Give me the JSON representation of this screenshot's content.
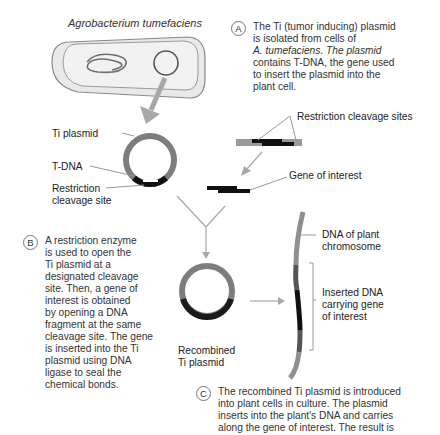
{
  "organism_title": "Agrobacterium tumefaciens",
  "steps": {
    "A": {
      "marker": "A",
      "lines": [
        "The Ti (tumor inducing) plasmid",
        "is isolated from cells of",
        "A. tumefaciens. The plasmid",
        "contains T-DNA, the gene used",
        "to insert the plasmid into the",
        "plant cell."
      ]
    },
    "B": {
      "marker": "B",
      "lines": [
        "A restriction enzyme",
        "is used to open the",
        "Ti plasmid at a",
        "designated cleavage",
        "site. Then, a gene of",
        "interest is obtained",
        "by opening a DNA",
        "fragment at the same",
        "cleavage site. The gene",
        "is inserted into the Ti",
        "plasmid using DNA",
        "ligase to seal the",
        "chemical bonds."
      ]
    },
    "C": {
      "marker": "C",
      "lines": [
        "The recombined Ti plasmid is introduced",
        "into plant cells in culture. The plasmid",
        "inserts into the plant's DNA and carries",
        "along the gene of interest. The result is"
      ]
    }
  },
  "labels": {
    "ti_plasmid": "Ti plasmid",
    "t_dna": "T-DNA",
    "restriction_site_1": "Restriction",
    "restriction_site_2": "cleavage site",
    "restriction_sites": "Restriction cleavage sites",
    "gene_of_interest": "Gene of interest",
    "plant_dna_1": "DNA of plant",
    "plant_dna_2": "chromosome",
    "inserted_1": "Inserted DNA",
    "inserted_2": "carrying gene",
    "inserted_3": "of interest",
    "recombined_1": "Recombined",
    "recombined_2": "Ti plasmid"
  },
  "colors": {
    "plasmid_gray": "#7d7d7d",
    "dna_black": "#111111",
    "arrow_gray": "#a8a8a8",
    "leader_gray": "#9a9a9a"
  }
}
